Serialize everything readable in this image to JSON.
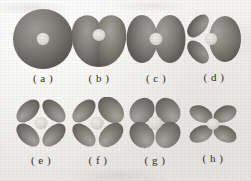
{
  "figure": {
    "kind": "orbital-shape-plate",
    "rows": 2,
    "columns": 4,
    "background_color": "#f1f0ed",
    "lobe_dark_color": "#5d5b58",
    "lobe_mid_color": "#868380",
    "lobe_light_color": "#b8b5b1",
    "nucleus_color": "#dedbd6",
    "label_color": "#2e2c2a"
  },
  "panels": [
    {
      "id": "a",
      "label": "( a )",
      "shape": "sphere",
      "description": "single spherical lobe with central nucleus",
      "lobes": 1,
      "width": 62,
      "height": 62,
      "x": 12,
      "y": 8
    },
    {
      "id": "b",
      "label": "( b )",
      "shape": "heart-two-lobe",
      "description": "two fused lobes with notch at top",
      "lobes": 2,
      "width": 58,
      "height": 60,
      "x": 70,
      "y": 9
    },
    {
      "id": "c",
      "label": "( c )",
      "shape": "horizontal-dumbbell",
      "description": "two horizontal lobes meeting at nucleus",
      "lobes": 2,
      "width": 60,
      "height": 52,
      "x": 126,
      "y": 13
    },
    {
      "id": "d",
      "label": "( d )",
      "shape": "three-lobe-asymmetric",
      "description": "large right lobe and two angled left lobes",
      "lobes": 3,
      "width": 56,
      "height": 50,
      "x": 186,
      "y": 14
    },
    {
      "id": "e",
      "label": "( e )",
      "shape": "four-lobe-diagonal",
      "description": "four narrow lobes on 45 degree diagonals",
      "lobes": 4,
      "width": 54,
      "height": 50,
      "x": 14,
      "y": 98
    },
    {
      "id": "f",
      "label": "( f )",
      "shape": "four-lobe-diagonal-wide",
      "description": "four diagonal lobes, upper right lobe broader",
      "lobes": 4,
      "width": 56,
      "height": 52,
      "x": 70,
      "y": 97
    },
    {
      "id": "g",
      "label": "( g )",
      "shape": "four-lobe-rounded",
      "description": "four broad rounded petals",
      "lobes": 4,
      "width": 58,
      "height": 54,
      "x": 126,
      "y": 96
    },
    {
      "id": "h",
      "label": "( h )",
      "shape": "four-lobe-flattened",
      "description": "four lobes, horizontally spread and compact",
      "lobes": 4,
      "width": 50,
      "height": 44,
      "x": 188,
      "y": 102
    }
  ]
}
